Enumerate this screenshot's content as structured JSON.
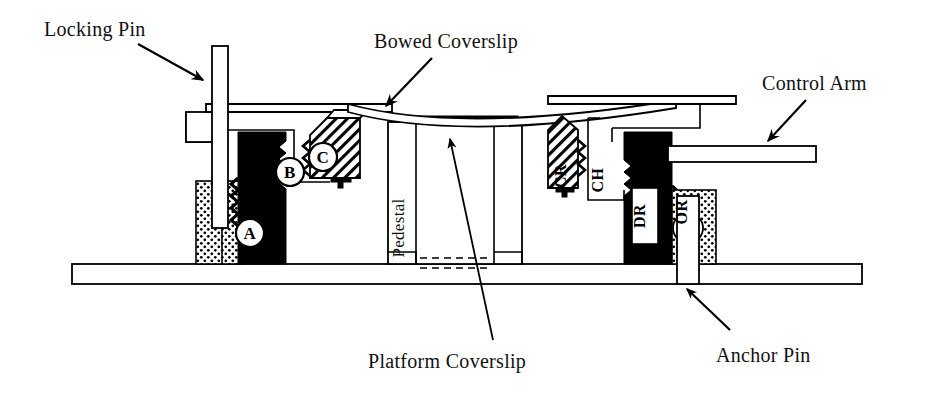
{
  "figure": {
    "background_color": "#ffffff",
    "line_color": "#000000",
    "width": 936,
    "height": 394
  },
  "callouts": [
    {
      "id": "locking-pin",
      "label": "Locking Pin",
      "text_x": 44,
      "text_y": 36,
      "arrow": {
        "x1": 138,
        "y1": 44,
        "x2": 203,
        "y2": 80
      }
    },
    {
      "id": "bowed-coverslip",
      "label": "Bowed Coverslip",
      "text_x": 374,
      "text_y": 48,
      "arrow": {
        "x1": 432,
        "y1": 58,
        "x2": 384,
        "y2": 108
      }
    },
    {
      "id": "control-arm",
      "label": "Control Arm",
      "text_x": 762,
      "text_y": 90,
      "arrow": {
        "x1": 806,
        "y1": 100,
        "x2": 766,
        "y2": 143
      }
    },
    {
      "id": "platform-coverslip",
      "label": "Platform Coverslip",
      "text_x": 368,
      "text_y": 368,
      "arrow": {
        "x1": 493,
        "y1": 340,
        "x2": 450,
        "y2": 139
      }
    },
    {
      "id": "anchor-pin",
      "label": "Anchor Pin",
      "text_x": 716,
      "text_y": 362,
      "arrow": {
        "x1": 730,
        "y1": 330,
        "x2": 686,
        "y2": 288
      }
    }
  ],
  "inline_labels": [
    {
      "id": "pedestal",
      "label": "Pedestal",
      "x": 404,
      "y": 228,
      "rotation": -90
    }
  ],
  "part_codes": [
    {
      "id": "part-cr",
      "label": "CR",
      "x": 566,
      "y": 176,
      "rotation": -90
    },
    {
      "id": "part-ch",
      "label": "CH",
      "x": 603,
      "y": 180,
      "rotation": -90
    },
    {
      "id": "part-dr",
      "label": "DR",
      "x": 644,
      "y": 216,
      "rotation": -90
    },
    {
      "id": "part-or",
      "label": "OR",
      "x": 684,
      "y": 212,
      "rotation": -90
    }
  ],
  "badges": [
    {
      "id": "badge-a",
      "label": "A",
      "cx": 250,
      "cy": 233,
      "r": 14
    },
    {
      "id": "badge-b",
      "label": "B",
      "cx": 290,
      "cy": 172,
      "r": 14
    },
    {
      "id": "badge-c",
      "label": "C",
      "cx": 323,
      "cy": 157,
      "r": 14
    }
  ],
  "components": {
    "base_plate": "long horizontal base rail",
    "pedestal": "central pedestal column supporting platform coverslip",
    "bowed_coverslip": "flexible coverslip bowed downward at center",
    "platform_coverslip": "thin dark strip on top of pedestal",
    "locking_pin": "vertical pin through left bracket",
    "anchor_pin": "vertical pin through right O-ring block",
    "control_arm": "horizontal arm extending to the right",
    "driver_block": "solid black driver block labeled DR",
    "o_ring_block": "stippled block with O-ring labeled OR",
    "compression_ramp": "hatched wedge labeled CR",
    "clamp_holder": "bracket labeled CH"
  }
}
